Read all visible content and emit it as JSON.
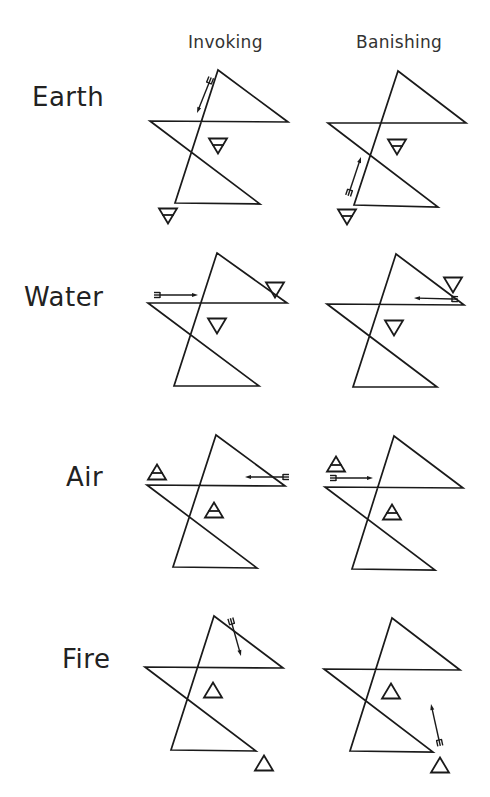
{
  "columns": [
    {
      "label": "Invoking",
      "x": 188,
      "y": 32
    },
    {
      "label": "Banishing",
      "x": 356,
      "y": 32
    }
  ],
  "rows": [
    {
      "label": "Earth",
      "label_pos": [
        32,
        82
      ],
      "element_symbol": "earth-triangle-down-bar",
      "invoking": {
        "star": [
          [
            218,
            70
          ],
          [
            288,
            122
          ],
          [
            150,
            121
          ],
          [
            260,
            204
          ],
          [
            175,
            203
          ]
        ],
        "inner_symbol": {
          "cx": 218,
          "cy": 146,
          "dir": "down",
          "bar": true
        },
        "outer_symbol": {
          "cx": 168,
          "cy": 216,
          "dir": "down",
          "bar": true
        },
        "arrow": {
          "from": [
            209,
            83
          ],
          "to": [
            197,
            113
          ],
          "direction": "toward lower-left point"
        }
      },
      "banishing": {
        "star": [
          [
            398,
            71
          ],
          [
            466,
            123
          ],
          [
            328,
            123
          ],
          [
            438,
            207
          ],
          [
            354,
            205
          ]
        ],
        "inner_symbol": {
          "cx": 397,
          "cy": 147,
          "dir": "down",
          "bar": true
        },
        "outer_symbol": {
          "cx": 347,
          "cy": 217,
          "dir": "down",
          "bar": true
        },
        "arrow": {
          "from": [
            350,
            190
          ],
          "to": [
            361,
            157
          ],
          "direction": "from lower-left point toward top"
        }
      }
    },
    {
      "label": "Water",
      "label_pos": [
        24,
        282
      ],
      "element_symbol": "water-triangle-down",
      "invoking": {
        "star": [
          [
            217,
            253
          ],
          [
            287,
            303
          ],
          [
            148,
            303
          ],
          [
            259,
            386
          ],
          [
            174,
            386
          ]
        ],
        "inner_symbol": {
          "cx": 217,
          "cy": 326,
          "dir": "down",
          "bar": false
        },
        "outer_symbol": {
          "cx": 275,
          "cy": 290,
          "dir": "down",
          "bar": false
        },
        "arrow": {
          "from": [
            160,
            295
          ],
          "to": [
            198,
            295
          ],
          "direction": "left point toward right point"
        }
      },
      "banishing": {
        "star": [
          [
            396,
            254
          ],
          [
            464,
            305
          ],
          [
            327,
            304
          ],
          [
            437,
            387
          ],
          [
            353,
            387
          ]
        ],
        "inner_symbol": {
          "cx": 394,
          "cy": 328,
          "dir": "down",
          "bar": false
        },
        "outer_symbol": {
          "cx": 453,
          "cy": 285,
          "dir": "down",
          "bar": false
        },
        "arrow": {
          "from": [
            452,
            299
          ],
          "to": [
            414,
            298
          ],
          "direction": "right point toward left point"
        }
      }
    },
    {
      "label": "Air",
      "label_pos": [
        66,
        462
      ],
      "element_symbol": "air-triangle-up-bar",
      "invoking": {
        "star": [
          [
            216,
            435
          ],
          [
            285,
            486
          ],
          [
            147,
            485
          ],
          [
            257,
            568
          ],
          [
            173,
            567
          ]
        ],
        "inner_symbol": {
          "cx": 214,
          "cy": 510,
          "dir": "up",
          "bar": true
        },
        "outer_symbol": {
          "cx": 157,
          "cy": 472,
          "dir": "up",
          "bar": true
        },
        "arrow": {
          "from": [
            283,
            477
          ],
          "to": [
            245,
            477
          ],
          "direction": "right point toward left point"
        }
      },
      "banishing": {
        "star": [
          [
            394,
            436
          ],
          [
            463,
            488
          ],
          [
            325,
            487
          ],
          [
            435,
            570
          ],
          [
            352,
            569
          ]
        ],
        "inner_symbol": {
          "cx": 392,
          "cy": 512,
          "dir": "up",
          "bar": true
        },
        "outer_symbol": {
          "cx": 336,
          "cy": 464,
          "dir": "up",
          "bar": true
        },
        "arrow": {
          "from": [
            336,
            478
          ],
          "to": [
            373,
            478
          ],
          "direction": "left point toward right point"
        }
      }
    },
    {
      "label": "Fire",
      "label_pos": [
        62,
        644
      ],
      "element_symbol": "fire-triangle-up",
      "invoking": {
        "star": [
          [
            214,
            616
          ],
          [
            283,
            668
          ],
          [
            145,
            667
          ],
          [
            256,
            751
          ],
          [
            171,
            750
          ]
        ],
        "inner_symbol": {
          "cx": 213,
          "cy": 690,
          "dir": "up",
          "bar": false
        },
        "outer_symbol": {
          "cx": 264,
          "cy": 763,
          "dir": "up",
          "bar": false
        },
        "arrow": {
          "from": [
            232,
            624
          ],
          "to": [
            241,
            656
          ],
          "direction": "top point toward lower-right point"
        }
      },
      "banishing": {
        "star": [
          [
            392,
            618
          ],
          [
            460,
            670
          ],
          [
            324,
            669
          ],
          [
            433,
            752
          ],
          [
            350,
            751
          ]
        ],
        "inner_symbol": {
          "cx": 391,
          "cy": 691,
          "dir": "up",
          "bar": false
        },
        "outer_symbol": {
          "cx": 440,
          "cy": 765,
          "dir": "up",
          "bar": false
        },
        "arrow": {
          "from": [
            439,
            740
          ],
          "to": [
            431,
            704
          ],
          "direction": "lower-right point toward top"
        }
      }
    }
  ]
}
